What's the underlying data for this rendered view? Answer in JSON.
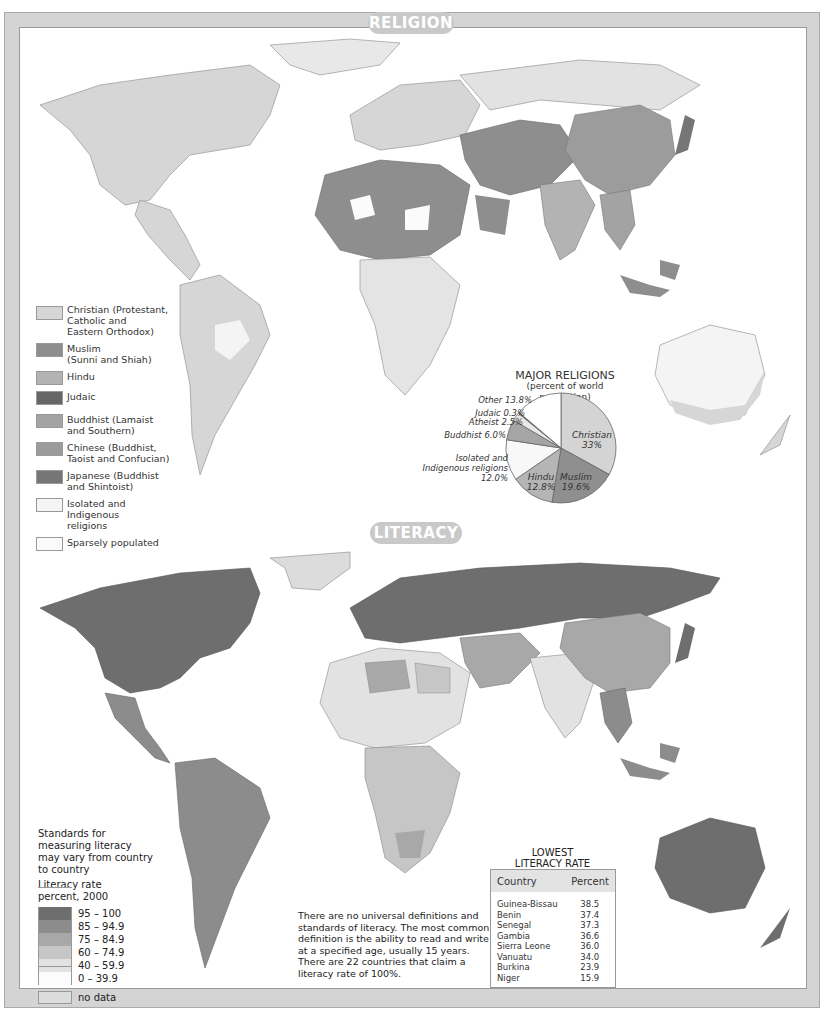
{
  "religion": {
    "title": "RELIGION",
    "legend": [
      {
        "label": "Christian (Protestant, Catholic and Eastern Orthodox)",
        "lines": [
          "Christian (Protestant,",
          "Catholic and",
          "Eastern Orthodox)"
        ],
        "color": "#d6d6d6"
      },
      {
        "label": "Muslim (Sunni and Shiah)",
        "lines": [
          "Muslim",
          "(Sunni and Shiah)"
        ],
        "color": "#8e8e8e"
      },
      {
        "label": "Hindu",
        "lines": [
          "Hindu"
        ],
        "color": "#b3b3b3"
      },
      {
        "label": "Judaic",
        "lines": [
          "Judaic"
        ],
        "color": "#666666"
      },
      {
        "label": "Buddhist (Lamaist and Southern)",
        "lines": [
          "Buddhist (Lamaist",
          "and Southern)"
        ],
        "color": "#a3a3a3"
      },
      {
        "label": "Chinese (Buddhist, Taoist and Confucian)",
        "lines": [
          "Chinese (Buddhist,",
          "Taoist and Confucian)"
        ],
        "color": "#9c9c9c"
      },
      {
        "label": "Japanese (Buddhist and Shintoist)",
        "lines": [
          "Japanese (Buddhist",
          "and Shintoist)"
        ],
        "color": "#767676"
      },
      {
        "label": "Isolated and Indigenous religions",
        "lines": [
          "Isolated and Indigenous",
          "religions"
        ],
        "color": "#f4f4f4"
      },
      {
        "label": "Sparsely populated",
        "lines": [
          "Sparsely populated"
        ],
        "color": "#fbfbfb"
      }
    ]
  },
  "literacy": {
    "title": "LITERACY",
    "legend_note": "Standards for measuring literacy may vary from country to country",
    "legend_title_1": "Literacy rate",
    "legend_title_2": "percent, 2000",
    "legend": [
      {
        "range": "95 – 100",
        "color": "#6e6e6e"
      },
      {
        "range": "85 – 94.9",
        "color": "#8c8c8c"
      },
      {
        "range": "75 – 84.9",
        "color": "#a8a8a8"
      },
      {
        "range": "60 – 74.9",
        "color": "#c6c6c6"
      },
      {
        "range": "40 – 59.9",
        "color": "#e2e2e2"
      },
      {
        "range": "0 – 39.9",
        "color": "#fcfcfc"
      },
      {
        "range": "no data",
        "color": "#dcdcdc"
      }
    ],
    "note": "There are no universal definitions and standards of literacy. The most common definition is the ability to read and write at a specified age, usually 15 years. There are 22 countries that claim a literacy rate of 100%.",
    "table": {
      "title_1": "LOWEST",
      "title_2": "LITERACY RATE",
      "headers": [
        "Country",
        "Percent"
      ],
      "rows": [
        {
          "country": "Guinea-Bissau",
          "percent": "38.5"
        },
        {
          "country": "Benin",
          "percent": "37.4"
        },
        {
          "country": "Senegal",
          "percent": "37.3"
        },
        {
          "country": "Gambia",
          "percent": "36.6"
        },
        {
          "country": "Sierra Leone",
          "percent": "36.0"
        },
        {
          "country": "Vanuatu",
          "percent": "34.0"
        },
        {
          "country": "Burkina",
          "percent": "23.9"
        },
        {
          "country": "Niger",
          "percent": "15.9"
        }
      ]
    }
  },
  "pie": {
    "title": "MAJOR RELIGIONS",
    "subtitle": "(percent of world population)",
    "slices": [
      {
        "name": "Christian",
        "value": 33.0,
        "label": "Christian",
        "pct": "33%",
        "color": "#d4d4d4"
      },
      {
        "name": "Muslim",
        "value": 19.6,
        "label": "Muslim",
        "pct": "19.6%",
        "color": "#8f8f8f"
      },
      {
        "name": "Hindu",
        "value": 12.8,
        "label": "Hindu",
        "pct": "12.8%",
        "color": "#b5b5b5"
      },
      {
        "name": "Isolated and Indigenous religions",
        "value": 12.0,
        "label": "Isolated and Indigenous religions 12.0%",
        "color": "#f8f8f8"
      },
      {
        "name": "Buddhist",
        "value": 6.0,
        "label": "Buddhist 6.0%",
        "color": "#a5a5a5"
      },
      {
        "name": "Atheist",
        "value": 2.5,
        "label": "Atheist 2.5%",
        "color": "#e8e8e8"
      },
      {
        "name": "Judaic",
        "value": 0.3,
        "label": "Judaic 0.3%",
        "color": "#555555"
      },
      {
        "name": "Other",
        "value": 13.8,
        "label": "Other 13.8%",
        "color": "#ffffff"
      }
    ],
    "outside_labels": {
      "other": "Other 13.8%",
      "judaic": "Judaic 0.3%",
      "atheist": "Atheist 2.5%",
      "buddhist": "Buddhist 6.0%",
      "isolated_1": "Isolated and",
      "isolated_2": "Indigenous religions",
      "isolated_3": "12.0%"
    }
  },
  "chart_data": {
    "type": "pie",
    "title": "MAJOR RELIGIONS",
    "subtitle": "(percent of world population)",
    "categories": [
      "Christian",
      "Muslim",
      "Hindu",
      "Isolated and Indigenous religions",
      "Buddhist",
      "Atheist",
      "Judaic",
      "Other"
    ],
    "values": [
      33.0,
      19.6,
      12.8,
      12.0,
      6.0,
      2.5,
      0.3,
      13.8
    ]
  }
}
